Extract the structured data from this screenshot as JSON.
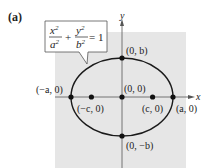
{
  "panel_label": "(a)",
  "equation": {
    "x_num": "x",
    "x_den": "a",
    "y_num": "y",
    "y_den": "b",
    "exp": "2",
    "plus": "+",
    "equals": "= 1"
  },
  "axes": {
    "x_label": "x",
    "y_label": "y"
  },
  "points": [
    {
      "id": "top-vertex",
      "label": "(0, b)",
      "x": 0,
      "y": 1
    },
    {
      "id": "bottom-vertex",
      "label": "(0, −b)",
      "x": 0,
      "y": -1
    },
    {
      "id": "left-vertex",
      "label": "(−a, 0)",
      "x": -1,
      "y": 0
    },
    {
      "id": "right-vertex",
      "label": "(a, 0)",
      "x": 1,
      "y": 0
    },
    {
      "id": "center",
      "label": "(0, 0)",
      "x": 0,
      "y": 0
    },
    {
      "id": "left-focus",
      "label": "(−c, 0)",
      "x": -0.6,
      "y": 0
    },
    {
      "id": "right-focus",
      "label": "(c, 0)",
      "x": 0.6,
      "y": 0
    }
  ],
  "colors": {
    "background_panel": "#e6e6e6",
    "curve": "#1a1a1a",
    "axis": "#444444"
  }
}
